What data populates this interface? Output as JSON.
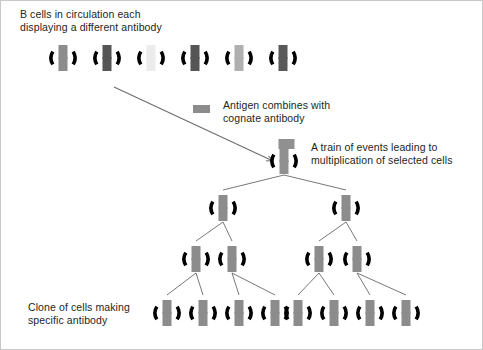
{
  "figure": {
    "background_color": "#ffffff",
    "border_color": "#c8c8c8"
  },
  "labels": {
    "b_cells": "B cells in circulation each\ndisplaying a different antibody",
    "antigen": "Antigen combines with\ncognate antibody",
    "train_of_events": "A train of events leading to\nmultiplication of selected cells",
    "clone": "Clone of cells making\nspecific antibody"
  },
  "colors": {
    "cell_ring": "#000000",
    "text": "#231f20",
    "arrow": "#6d6d6d",
    "tree_line": "#555555",
    "antibody_default": "#808080",
    "antibody_dark": "#555555",
    "antibody_medium": "#8c8c8c",
    "antibody_light": "#d9d9d9",
    "antibody_pale": "#ececec",
    "antibody_selected": "#909090"
  },
  "legend": {
    "antigen_swatch_color": "#8c8c8c",
    "antigen_swatch": {
      "x": 192,
      "y": 104,
      "w": 17,
      "h": 8
    }
  },
  "arrows": [
    {
      "name": "selection-arrow",
      "x1": 113,
      "y1": 86,
      "x2": 272,
      "y2": 160
    }
  ],
  "top_row": {
    "count": 6,
    "y": 57,
    "cells": [
      {
        "cx": 62,
        "shade": "#8c8c8c"
      },
      {
        "cx": 106,
        "shade": "#555555"
      },
      {
        "cx": 150,
        "shade": "#ececec"
      },
      {
        "cx": 194,
        "shade": "#555555"
      },
      {
        "cx": 238,
        "shade": "#b0b0b0"
      },
      {
        "cx": 282,
        "shade": "#595959"
      }
    ]
  },
  "tree": {
    "selected_cell": {
      "cx": 283,
      "cy": 160,
      "shade": "#909090",
      "antigen_bound": true
    },
    "rows": [
      {
        "level": 1,
        "cy": 207,
        "cells": [
          {
            "cx": 222
          },
          {
            "cx": 345
          }
        ]
      },
      {
        "level": 2,
        "cy": 258,
        "cells": [
          {
            "cx": 195
          },
          {
            "cx": 231
          },
          {
            "cx": 318
          },
          {
            "cx": 356
          }
        ]
      },
      {
        "level": 3,
        "cy": 312,
        "cells": [
          {
            "cx": 166
          },
          {
            "cx": 202
          },
          {
            "cx": 238
          },
          {
            "cx": 274
          },
          {
            "cx": 297
          },
          {
            "cx": 333
          },
          {
            "cx": 369
          },
          {
            "cx": 405
          }
        ]
      }
    ],
    "edges": [
      {
        "from": [
          283,
          160
        ],
        "to": [
          222,
          207
        ]
      },
      {
        "from": [
          283,
          160
        ],
        "to": [
          345,
          207
        ]
      },
      {
        "from": [
          222,
          207
        ],
        "to": [
          195,
          258
        ]
      },
      {
        "from": [
          222,
          207
        ],
        "to": [
          231,
          258
        ]
      },
      {
        "from": [
          345,
          207
        ],
        "to": [
          318,
          258
        ]
      },
      {
        "from": [
          345,
          207
        ],
        "to": [
          356,
          258
        ]
      },
      {
        "from": [
          195,
          258
        ],
        "to": [
          166,
          312
        ]
      },
      {
        "from": [
          195,
          258
        ],
        "to": [
          202,
          312
        ]
      },
      {
        "from": [
          231,
          258
        ],
        "to": [
          238,
          312
        ]
      },
      {
        "from": [
          231,
          258
        ],
        "to": [
          274,
          312
        ]
      },
      {
        "from": [
          318,
          258
        ],
        "to": [
          297,
          312
        ]
      },
      {
        "from": [
          318,
          258
        ],
        "to": [
          333,
          312
        ]
      },
      {
        "from": [
          356,
          258
        ],
        "to": [
          369,
          312
        ]
      },
      {
        "from": [
          356,
          258
        ],
        "to": [
          405,
          312
        ]
      }
    ]
  },
  "cell_geometry": {
    "ring_radius": 12,
    "ring_stroke": 3.6,
    "bar_width": 9,
    "bar_height": 11,
    "bar_gap": 2,
    "clone_shade": "#8c8c8c"
  }
}
